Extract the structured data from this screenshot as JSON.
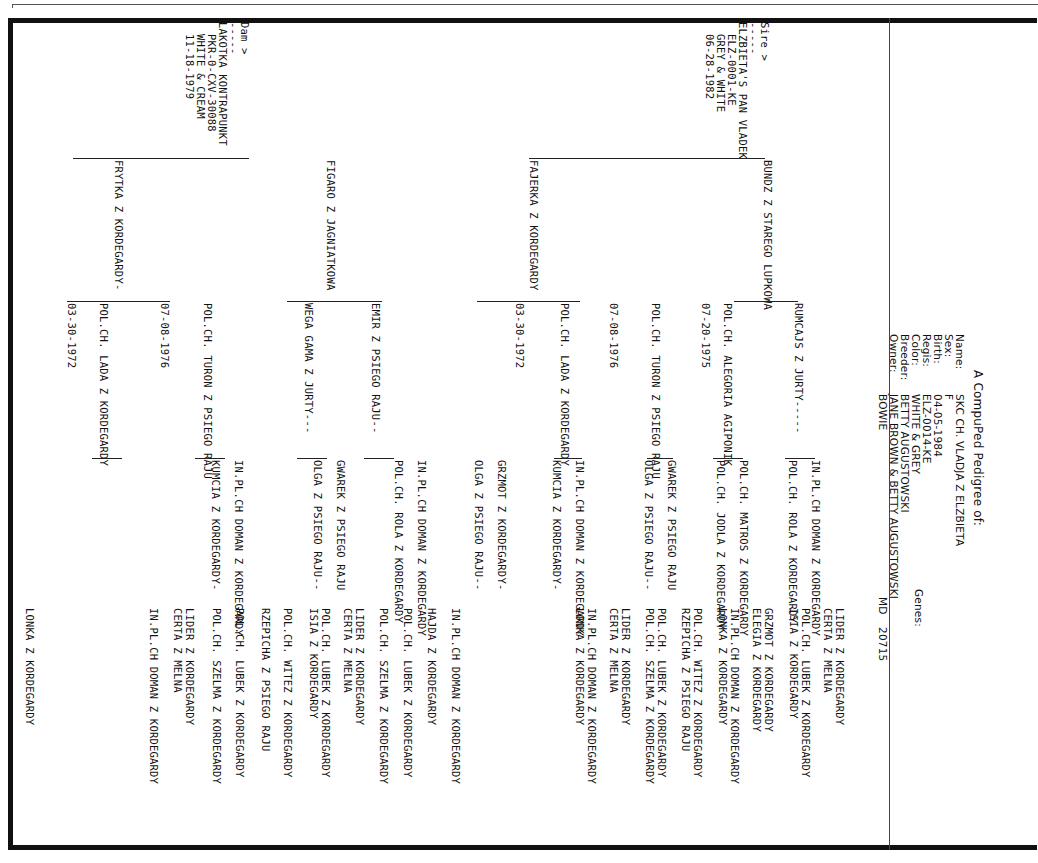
{
  "header": {
    "title": "A CompuPed Pedigree of:",
    "fields": [
      {
        "label": "Name:",
        "value": "SKC CH. VLADJA Z ELZBIETA"
      },
      {
        "label": "Sex:",
        "value": "F"
      },
      {
        "label": "Birth:",
        "value": "04-05-1984"
      },
      {
        "label": "Regis:",
        "value": "ELZ-0014-KE"
      },
      {
        "label": "Color:",
        "value": "WHITE & GREY"
      },
      {
        "label": "Breeder:",
        "value": "BETTY AUGUSTOWSKI"
      },
      {
        "label": "Owner:",
        "value": "JANE BROWN & BETTY AUGUSTOWSKI"
      }
    ],
    "owner_line2": "BOWIE",
    "owner_state": "MD",
    "owner_zip": "20715",
    "genes_label": "Genes:"
  },
  "sire": {
    "heading": "Sire >",
    "dashes": "-----",
    "name": "ELZBIETA'S PAN VLADEK",
    "regis": "ELZ-0001-KE",
    "color": "GREY & WHITE",
    "birth": "06-28-1982"
  },
  "dam": {
    "heading": "Dam >",
    "dashes": "-----",
    "name": "LAKOTKA KONTRAPUNKT",
    "regis": "PKR-0-CXV-30088",
    "color": "WHITE & CREAM",
    "birth": "11-18-1979"
  },
  "gen2": [
    {
      "name": "BUNDZ Z STAREGO LUPKOWA"
    },
    {
      "name": "FAJERKA Z KORDEGARDY"
    },
    {
      "name": "FIGARO Z JAGNIATKOWA"
    },
    {
      "name": "FRYTKA Z KORDEGARDY-"
    }
  ],
  "gen3": [
    {
      "name": "RUMCAJS Z JURTY-----",
      "date": ""
    },
    {
      "name": "POL.CH. ALEGORIA AGIPONIK",
      "date": "07-20-1975"
    },
    {
      "name": "POL.CH. TURON Z PSIEGO RAJU",
      "date": "07-08-1976"
    },
    {
      "name": "POL.CH. LADA Z KORDEGARDY",
      "date": "03-30-1972"
    },
    {
      "name": "EMIR Z PSIEGO RAJU--",
      "date": ""
    },
    {
      "name": "WEGA GAMA Z JURTY---",
      "date": ""
    },
    {
      "name": "POL.CH. TURON Z PSIEGO RAJU",
      "date": "07-08-1976"
    },
    {
      "name": "POL.CH. LADA Z KORDEGARDY",
      "date": "03-30-1972"
    }
  ],
  "gen4": [
    "IN.PL.CH DOMAN Z KORDEGARDY",
    "POL.CH. ROLA Z KORDEGARDY",
    "POL.CH. MATROS Z KORDEGARDY",
    "POL.CH. JODLA Z KORDEGARDY",
    "GWAREK Z PSIEGO RAJU",
    "OLGA Z PSIEGO RAJU--",
    "IN.PL.CH DOMAN Z KORDEGARDY",
    "KUMCIA Z KORDEGARDY-",
    "GRZMOT Z KORDEGARDY-",
    "OLGA Z PSIEGO RAJU--",
    "IN.PL.CH DOMAN Z KORDEGARDY",
    "POL.CH. ROLA Z KORDEGARDY",
    "GWAREK Z PSIEGO RAJU",
    "OLGA Z PSIEGO RAJU--",
    "IN.PL.CH DOMAN Z KORDEGARDY",
    "KUMCIA Z KORDEGARDY-"
  ],
  "gen5": [
    "LIDER Z KORDEGARDY",
    "CERTA Z MELNA",
    "POL.CH. LUBEK Z KORDEGARDY",
    "ISIA Z KORDEGARDY",
    "GRZMOT Z KORDEGARDY",
    "ELEGIA Z KORDEGARDY",
    "IN.PL.CH DOMAN Z KORDEGARDY",
    "LONKA Z KORDEGARDY",
    "POL.CH. WITEZ Z KORDEGARDY",
    "RZEPICHA Z PSIEGO RAJU",
    "POL.CH. LUBEK Z KORDEGARDY",
    "POL.CH. SZELMA Z KORDEGARDY",
    "LIDER Z KORDEGARDY",
    "CERTA Z MELNA",
    "IN.PL.CH DOMAN Z KORDEGARDY",
    "LONKA Z KORDEGARDY",
    "IN.PL.CH DOMAN Z KORDEGARDY",
    "HAJDA Z KORDEGARDY",
    "POL.CH. LUBEK Z KORDEGARDY",
    "POL.CH. SZELMA Z KORDEGARDY",
    "LIDER Z KORDEGARDY",
    "CERTA Z MELNA",
    "POL.CH. LUBEK Z KORDEGARDY",
    "ISIA Z KORDEGARDY",
    "POL.CH. WITEZ Z KORDEGARDY",
    "RZEPICHA Z PSIEGO RAJU",
    "POL.CH. LUBEK Z KORDEGARDY",
    "POL.CH. SZELMA Z KORDEGARDY",
    "LIDER Z KORDEGARDY",
    "CERTA Z MELNA",
    "IN.PL.CH DOMAN Z KORDEGARDY",
    "LONKA Z KORDEGARDY"
  ]
}
